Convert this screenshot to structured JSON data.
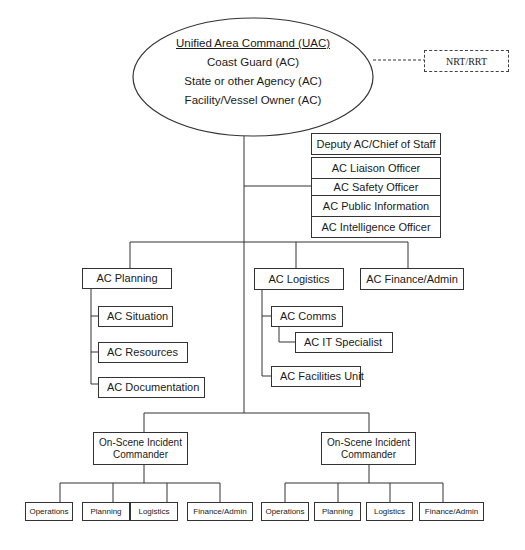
{
  "diagram": {
    "type": "organization-chart",
    "top": {
      "title": "Unified Area Command (UAC)",
      "members": [
        "Coast Guard (AC)",
        "State or other Agency (AC)",
        "Facility/Vessel Owner (AC)"
      ],
      "advisory": "NRT/RRT"
    },
    "command_staff": {
      "deputy": "Deputy AC/Chief of Staff",
      "officers": [
        "AC Liaison Officer",
        "AC Safety Officer",
        "AC Public Information",
        "AC Intelligence Officer"
      ]
    },
    "general_staff": {
      "planning": {
        "label": "AC Planning",
        "units": [
          "AC Situation",
          "AC Resources",
          "AC Documentation"
        ]
      },
      "logistics": {
        "label": "AC Logistics",
        "comms": "AC Comms",
        "it": "AC IT Specialist",
        "facilities": "AC Facilities Unit"
      },
      "finance": {
        "label": "AC Finance/Admin"
      }
    },
    "incident_commanders": [
      {
        "label": "On-Scene Incident Commander",
        "sections": [
          "Operations",
          "Planning",
          "Logistics",
          "Finance/Admin"
        ]
      },
      {
        "label": "On-Scene Incident Commander",
        "sections": [
          "Operations",
          "Planning",
          "Logistics",
          "Finance/Admin"
        ]
      }
    ]
  }
}
